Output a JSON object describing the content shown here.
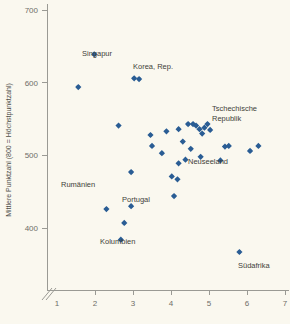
{
  "axes": {
    "y_title": "Mittlere Punktzahl (800 = Höchstpunktzahl)",
    "y_ticks": [
      "700",
      "600",
      "500",
      "400"
    ],
    "x_ticks": [
      "1",
      "2",
      "3",
      "4",
      "5",
      "6",
      "7"
    ],
    "x_title": "",
    "axis_break_icon": "axis-break-slashes"
  },
  "colors": {
    "background": "#faf8ef",
    "marker": "#2a5d94",
    "axis": "#9a9a94",
    "label_text": "#3f3f3a",
    "tick_text": "#6e6e68"
  },
  "chart_data": {
    "type": "scatter",
    "title": "",
    "xlabel": "",
    "ylabel": "Mittlere Punktzahl (800 = Höchstpunktzahl)",
    "xlim": [
      0.6,
      7.4
    ],
    "ylim": [
      360,
      710
    ],
    "xticks": [
      1,
      2,
      3,
      4,
      5,
      6,
      7
    ],
    "yticks": [
      400,
      500,
      600,
      700
    ],
    "grid": false,
    "legend": "none",
    "axis_break": {
      "axis": "x",
      "near": 1
    },
    "points": [
      {
        "x": 1.98,
        "y": 639,
        "label": "Singapur",
        "label_pos": "right"
      },
      {
        "x": 1.56,
        "y": 594,
        "label": "",
        "label_pos": ""
      },
      {
        "x": 3.03,
        "y": 606,
        "label": "Korea, Rep.",
        "label_pos": "above-right"
      },
      {
        "x": 3.16,
        "y": 605,
        "label": "",
        "label_pos": ""
      },
      {
        "x": 2.62,
        "y": 541,
        "label": "",
        "label_pos": ""
      },
      {
        "x": 3.46,
        "y": 528,
        "label": "",
        "label_pos": ""
      },
      {
        "x": 3.5,
        "y": 513,
        "label": "",
        "label_pos": ""
      },
      {
        "x": 3.76,
        "y": 503,
        "label": "",
        "label_pos": ""
      },
      {
        "x": 2.95,
        "y": 477,
        "label": "",
        "label_pos": ""
      },
      {
        "x": 3.88,
        "y": 533,
        "label": "",
        "label_pos": ""
      },
      {
        "x": 4.2,
        "y": 536,
        "label": "",
        "label_pos": ""
      },
      {
        "x": 4.31,
        "y": 519,
        "label": "",
        "label_pos": ""
      },
      {
        "x": 4.45,
        "y": 543,
        "label": "",
        "label_pos": ""
      },
      {
        "x": 4.58,
        "y": 543,
        "label": "",
        "label_pos": ""
      },
      {
        "x": 4.66,
        "y": 541,
        "label": "",
        "label_pos": ""
      },
      {
        "x": 4.75,
        "y": 536,
        "label": "",
        "label_pos": ""
      },
      {
        "x": 4.82,
        "y": 530,
        "label": "",
        "label_pos": ""
      },
      {
        "x": 4.88,
        "y": 538,
        "label": "",
        "label_pos": ""
      },
      {
        "x": 4.96,
        "y": 543,
        "label": "",
        "label_pos": ""
      },
      {
        "x": 5.03,
        "y": 535,
        "label": "",
        "label_pos": ""
      },
      {
        "x": 4.2,
        "y": 489,
        "label": "",
        "label_pos": ""
      },
      {
        "x": 4.38,
        "y": 494,
        "label": "",
        "label_pos": ""
      },
      {
        "x": 4.52,
        "y": 509,
        "label": "",
        "label_pos": ""
      },
      {
        "x": 4.02,
        "y": 471,
        "label": "",
        "label_pos": ""
      },
      {
        "x": 4.17,
        "y": 467,
        "label": "",
        "label_pos": ""
      },
      {
        "x": 4.08,
        "y": 444,
        "label": "Portugal",
        "label_pos": "right"
      },
      {
        "x": 5.42,
        "y": 512,
        "label": "Tschechische Republik",
        "label_pos": "right-two-line"
      },
      {
        "x": 5.3,
        "y": 493,
        "label": "",
        "label_pos": ""
      },
      {
        "x": 5.52,
        "y": 513,
        "label": "",
        "label_pos": ""
      },
      {
        "x": 4.78,
        "y": 498,
        "label": "Neuseeland",
        "label_pos": "below-right"
      },
      {
        "x": 6.08,
        "y": 506,
        "label": "",
        "label_pos": ""
      },
      {
        "x": 6.3,
        "y": 513,
        "label": "",
        "label_pos": ""
      },
      {
        "x": 2.3,
        "y": 426,
        "label": "Rumänien",
        "label_pos": "below-left"
      },
      {
        "x": 2.95,
        "y": 430,
        "label": "",
        "label_pos": ""
      },
      {
        "x": 2.77,
        "y": 407,
        "label": "",
        "label_pos": ""
      },
      {
        "x": 2.68,
        "y": 384,
        "label": "Kolumbien",
        "label_pos": "right"
      },
      {
        "x": 5.8,
        "y": 367,
        "label": "Südafrika",
        "label_pos": "right"
      }
    ]
  },
  "labels": [
    {
      "text": "Singapur",
      "x": 82,
      "y": 56
    },
    {
      "text": "Korea, Rep.",
      "x": 133,
      "y": 69
    },
    {
      "text": "Tschechische",
      "x": 212,
      "y": 111
    },
    {
      "text": "Republik",
      "x": 212,
      "y": 121
    },
    {
      "text": "Neuseeland",
      "x": 188,
      "y": 164
    },
    {
      "text": "Rumänien",
      "x": 61,
      "y": 187
    },
    {
      "text": "Portugal",
      "x": 122,
      "y": 202
    },
    {
      "text": "Kolumbien",
      "x": 100,
      "y": 244
    },
    {
      "text": "Südafrika",
      "x": 238,
      "y": 268
    }
  ]
}
